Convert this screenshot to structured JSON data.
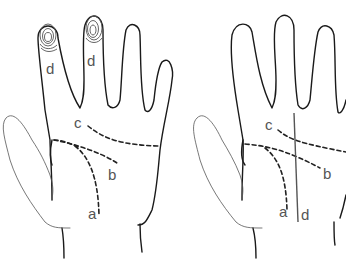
{
  "figure": {
    "colors": {
      "outline": "#1a1a1a",
      "label": "#555555",
      "background": "#ffffff"
    }
  },
  "left_hand": {
    "labels": {
      "fingerprint_index": "d",
      "fingerprint_middle": "d",
      "crease_c": "c",
      "crease_b": "b",
      "crease_a": "a"
    }
  },
  "right_hand": {
    "labels": {
      "crease_c": "c",
      "crease_b": "b",
      "crease_a": "a",
      "line_d": "d"
    }
  }
}
